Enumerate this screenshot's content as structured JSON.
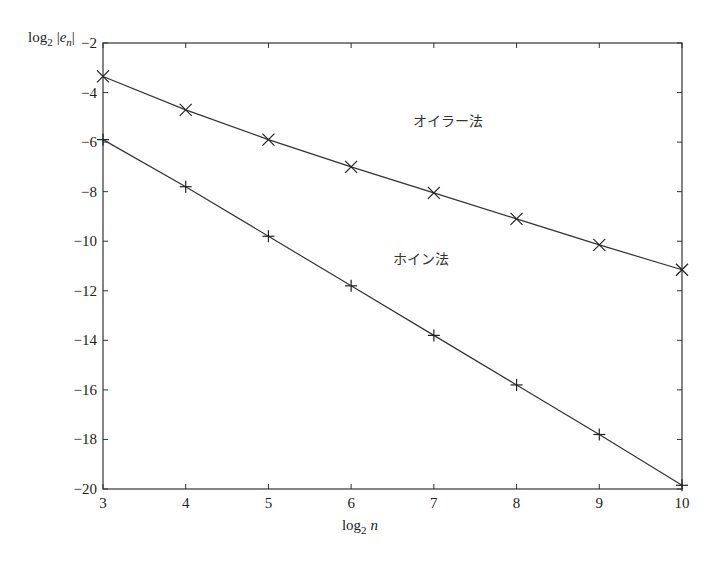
{
  "chart_data": {
    "type": "line",
    "title": "",
    "xlabel": "log2 n",
    "ylabel": "log2 |e_n|",
    "x": [
      3,
      4,
      5,
      6,
      7,
      8,
      9,
      10
    ],
    "xlim": [
      3,
      10
    ],
    "ylim": [
      -20,
      -2
    ],
    "xticks": [
      3,
      4,
      5,
      6,
      7,
      8,
      9,
      10
    ],
    "yticks": [
      -2,
      -4,
      -6,
      -8,
      -10,
      -12,
      -14,
      -16,
      -18,
      -20
    ],
    "grid": false,
    "legend": "inline annotations",
    "series": [
      {
        "name": "オイラー法",
        "marker": "x",
        "values": [
          -3.35,
          -4.7,
          -5.9,
          -7.0,
          -8.05,
          -9.1,
          -10.15,
          -11.15
        ],
        "label_pos": {
          "x": 6.75,
          "y": -5.35
        }
      },
      {
        "name": "ホイン法",
        "marker": "+",
        "values": [
          -5.9,
          -7.8,
          -9.8,
          -11.8,
          -13.8,
          -15.8,
          -17.8,
          -19.85
        ],
        "label_pos": {
          "x": 6.5,
          "y": -10.9
        }
      }
    ]
  },
  "labels": {
    "xlabel_main": "log",
    "xlabel_sub": "2",
    "xlabel_var": "n",
    "ylabel_main": "log",
    "ylabel_sub": "2",
    "ylabel_var": "e",
    "ylabel_var_sub": "n"
  }
}
